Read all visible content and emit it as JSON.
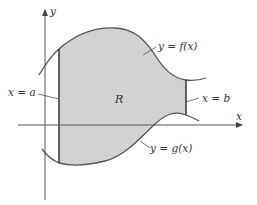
{
  "figure": {
    "colors": {
      "region_fill": "#d2d2d2",
      "curve_stroke": "#555555",
      "axis_stroke": "#555555",
      "label_color": "#333333",
      "background": "#ffffff"
    },
    "axes": {
      "x_label": "x",
      "y_label": "y"
    },
    "labels": {
      "upper_curve": "y = f(x)",
      "lower_curve": "y = g(x)",
      "left_bound": "x = a",
      "right_bound": "x = b",
      "region": "R"
    },
    "geometry": {
      "y_axis_x": 45,
      "x_axis_y": 125,
      "a_x": 59,
      "b_x": 186,
      "f_at_a_y": 49,
      "f_at_b_y": 80,
      "g_at_a_y": 163,
      "g_at_b_y": 115
    }
  }
}
